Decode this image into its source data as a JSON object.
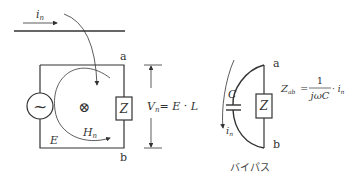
{
  "left_diagram": {
    "current_label": "i",
    "current_sub": "n",
    "node_a": "a",
    "node_b": "b",
    "source_symbol": "~",
    "flux_symbol": "⊗",
    "impedance_label": "Z",
    "emf_label": "E",
    "field_label": "H",
    "field_sub": "n",
    "voltage_label": "V",
    "voltage_sub": "n",
    "voltage_expr": "= E · L"
  },
  "right_diagram": {
    "node_a": "a",
    "node_b": "b",
    "capacitor_label": "C",
    "impedance_label": "Z",
    "current_label": "i",
    "current_sub": "n",
    "formula_lhs": "Z",
    "formula_lhs_sub": "ab",
    "formula_eq": "=",
    "formula_num": "1",
    "formula_den": "jωC",
    "formula_tail": "· i",
    "formula_tail_sub": "n",
    "caption": "バイパス"
  },
  "colors": {
    "stroke": "#333333",
    "background": "#ffffff"
  }
}
